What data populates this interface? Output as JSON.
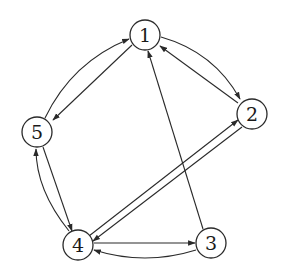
{
  "diagram": {
    "type": "directed-graph",
    "nodes": [
      {
        "id": "1",
        "label": "1",
        "x": 145,
        "y": 35
      },
      {
        "id": "2",
        "label": "2",
        "x": 252,
        "y": 114
      },
      {
        "id": "3",
        "label": "3",
        "x": 211,
        "y": 243
      },
      {
        "id": "4",
        "label": "4",
        "x": 78,
        "y": 245
      },
      {
        "id": "5",
        "label": "5",
        "x": 37,
        "y": 132
      }
    ],
    "edges": [
      {
        "from": "1",
        "to": "2",
        "style": "curved"
      },
      {
        "from": "2",
        "to": "1",
        "style": "straight"
      },
      {
        "from": "5",
        "to": "1",
        "style": "curved"
      },
      {
        "from": "1",
        "to": "5",
        "style": "straight"
      },
      {
        "from": "4",
        "to": "5",
        "style": "curved"
      },
      {
        "from": "5",
        "to": "4",
        "style": "straight"
      },
      {
        "from": "4",
        "to": "2",
        "style": "straight"
      },
      {
        "from": "2",
        "to": "4",
        "style": "straight"
      },
      {
        "from": "4",
        "to": "3",
        "style": "straight"
      },
      {
        "from": "3",
        "to": "4",
        "style": "curved"
      },
      {
        "from": "3",
        "to": "1",
        "style": "straight"
      }
    ],
    "node_radius": 15,
    "stroke_color": "#2a2a2a"
  }
}
